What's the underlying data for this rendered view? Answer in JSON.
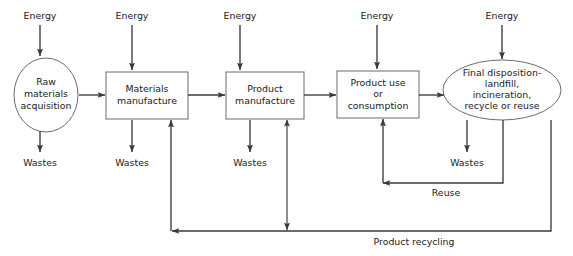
{
  "diagram": {
    "type": "flowchart",
    "canvas": {
      "width": 573,
      "height": 256
    },
    "colors": {
      "background": "#ffffff",
      "shape_stroke": "#6b6b6b",
      "shape_fill": "#ffffff",
      "connector": "#3a3a3a",
      "text": "#1a1a1a"
    },
    "stages": [
      {
        "id": "raw-materials-acquisition",
        "shape": "ellipse",
        "lines": [
          "Raw",
          "materials",
          "acquisition"
        ],
        "cx": 46,
        "cy": 95,
        "rx": 32,
        "ry": 37
      },
      {
        "id": "materials-manufacture",
        "shape": "rect",
        "lines": [
          "Materials",
          "manufacture"
        ],
        "x": 106,
        "y": 72,
        "w": 82,
        "h": 47
      },
      {
        "id": "product-manufacture",
        "shape": "rect",
        "lines": [
          "Product",
          "manufacture"
        ],
        "x": 226,
        "y": 72,
        "w": 78,
        "h": 47
      },
      {
        "id": "product-use-or-consumption",
        "shape": "rect",
        "lines": [
          "Product use",
          "or",
          "consumption"
        ],
        "x": 337,
        "y": 71,
        "w": 82,
        "h": 47
      },
      {
        "id": "final-disposition",
        "shape": "ellipse",
        "lines": [
          "Final disposition-",
          "landfill,",
          "incineration,",
          "recycle or reuse"
        ],
        "cx": 502,
        "cy": 90,
        "rx": 59,
        "ry": 30
      }
    ],
    "energy_inputs": [
      {
        "id": "energy-raw-materials",
        "label": "Energy",
        "x": 40,
        "label_y": 19,
        "arrow_from_y": 25,
        "arrow_to_y": 56
      },
      {
        "id": "energy-materials-manufacture",
        "label": "Energy",
        "x": 132,
        "label_y": 19,
        "arrow_from_y": 25,
        "arrow_to_y": 70
      },
      {
        "id": "energy-product-manufacture",
        "label": "Energy",
        "x": 240,
        "label_y": 19,
        "arrow_from_y": 25,
        "arrow_to_y": 70
      },
      {
        "id": "energy-product-use",
        "label": "Energy",
        "x": 377,
        "label_y": 19,
        "arrow_from_y": 25,
        "arrow_to_y": 69
      },
      {
        "id": "energy-final-disposition",
        "label": "Energy",
        "x": 502,
        "label_y": 19,
        "arrow_from_y": 25,
        "arrow_to_y": 59
      }
    ],
    "waste_outputs": [
      {
        "id": "wastes-raw-materials",
        "label": "Wastes",
        "x": 40,
        "label_y": 162,
        "arrow_from_y": 131,
        "arrow_to_y": 152
      },
      {
        "id": "wastes-materials-manufacture",
        "label": "Wastes",
        "x": 132,
        "label_y": 162,
        "arrow_from_y": 120,
        "arrow_to_y": 152
      },
      {
        "id": "wastes-product-manufacture",
        "label": "Wastes",
        "x": 250,
        "label_y": 162,
        "arrow_from_y": 120,
        "arrow_to_y": 152
      },
      {
        "id": "wastes-final-disposition",
        "label": "Wastes",
        "x": 467,
        "label_y": 162,
        "arrow_from_y": 120,
        "arrow_to_y": 152
      }
    ],
    "flow_labels": [
      {
        "id": "reuse-label",
        "label": "Reuse",
        "x": 446,
        "y": 196
      },
      {
        "id": "product-recycling-label",
        "label": "Product recycling",
        "x": 414,
        "y": 245
      }
    ],
    "connectors": [
      {
        "id": "raw-to-materials",
        "kind": "arrow-right"
      },
      {
        "id": "materials-to-product",
        "kind": "arrow-right"
      },
      {
        "id": "product-to-use",
        "kind": "arrow-right"
      },
      {
        "id": "use-to-disposition",
        "kind": "arrow-right"
      },
      {
        "id": "reuse-loop",
        "kind": "loop-back"
      },
      {
        "id": "product-recycling-loop",
        "kind": "loop-back"
      },
      {
        "id": "recycling-to-product-manufacture",
        "kind": "double-arrow"
      }
    ]
  }
}
